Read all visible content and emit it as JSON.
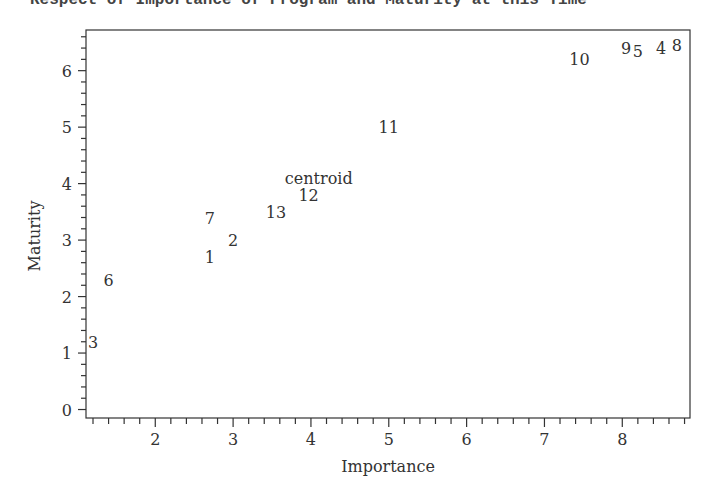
{
  "caption": "Respect of Importance of Program and Maturity at this Time",
  "chart_data": {
    "type": "scatter",
    "title": "",
    "xlabel": "Importance",
    "ylabel": "Maturity",
    "xlim": [
      1.11,
      8.87
    ],
    "ylim": [
      -0.15,
      6.72
    ],
    "xticks": [
      2,
      3,
      4,
      5,
      6,
      7,
      8
    ],
    "yticks": [
      0,
      1,
      2,
      3,
      4,
      5,
      6
    ],
    "x_minor_per_major": 5,
    "y_minor_per_major": 5,
    "grid": false,
    "legend": null,
    "points": [
      {
        "label": "3",
        "x": 1.2,
        "y": 1.2
      },
      {
        "label": "6",
        "x": 1.4,
        "y": 2.3
      },
      {
        "label": "1",
        "x": 2.7,
        "y": 2.7
      },
      {
        "label": "7",
        "x": 2.7,
        "y": 3.4
      },
      {
        "label": "2",
        "x": 3.0,
        "y": 3.0
      },
      {
        "label": "13",
        "x": 3.55,
        "y": 3.5
      },
      {
        "label": "12",
        "x": 3.97,
        "y": 3.8
      },
      {
        "label": "centroid",
        "x": 4.1,
        "y": 4.1
      },
      {
        "label": "11",
        "x": 5.0,
        "y": 5.0
      },
      {
        "label": "10",
        "x": 7.45,
        "y": 6.2
      },
      {
        "label": "9",
        "x": 8.05,
        "y": 6.4
      },
      {
        "label": "5",
        "x": 8.2,
        "y": 6.35
      },
      {
        "label": "4",
        "x": 8.5,
        "y": 6.4
      },
      {
        "label": "8",
        "x": 8.7,
        "y": 6.45
      }
    ]
  },
  "colors": {
    "axis": "#333333",
    "text": "#333333",
    "background": "#ffffff"
  }
}
